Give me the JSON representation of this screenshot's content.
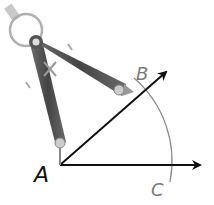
{
  "diagram": {
    "type": "geometry-construction",
    "points": {
      "A": {
        "label": "A",
        "x": 60,
        "y": 165
      },
      "B": {
        "label": "B",
        "x": 143,
        "y": 97
      },
      "C": {
        "label": "C",
        "x": 170,
        "y": 165
      }
    },
    "rays": [
      {
        "name": "ray-AB",
        "from": "A",
        "toward": [
          168,
          70
        ]
      },
      {
        "name": "ray-AC",
        "from": "A",
        "toward": [
          202,
          165
        ]
      }
    ],
    "arc": {
      "center": "A",
      "from": "B",
      "to": "C"
    },
    "colors": {
      "ray": "#111111",
      "arc": "#8a8a8a",
      "label_A": "#111111",
      "label_BC": "#7a7a7a",
      "compass_leg": "#555555",
      "compass_ring": "#b0b0b0"
    }
  }
}
